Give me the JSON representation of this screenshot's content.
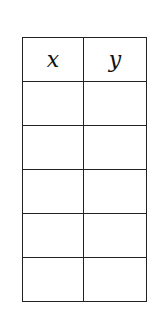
{
  "table": {
    "headers": [
      "x",
      "y"
    ],
    "rows": [
      [
        "",
        ""
      ],
      [
        "",
        ""
      ],
      [
        "",
        ""
      ],
      [
        "",
        ""
      ],
      [
        "",
        ""
      ]
    ]
  }
}
